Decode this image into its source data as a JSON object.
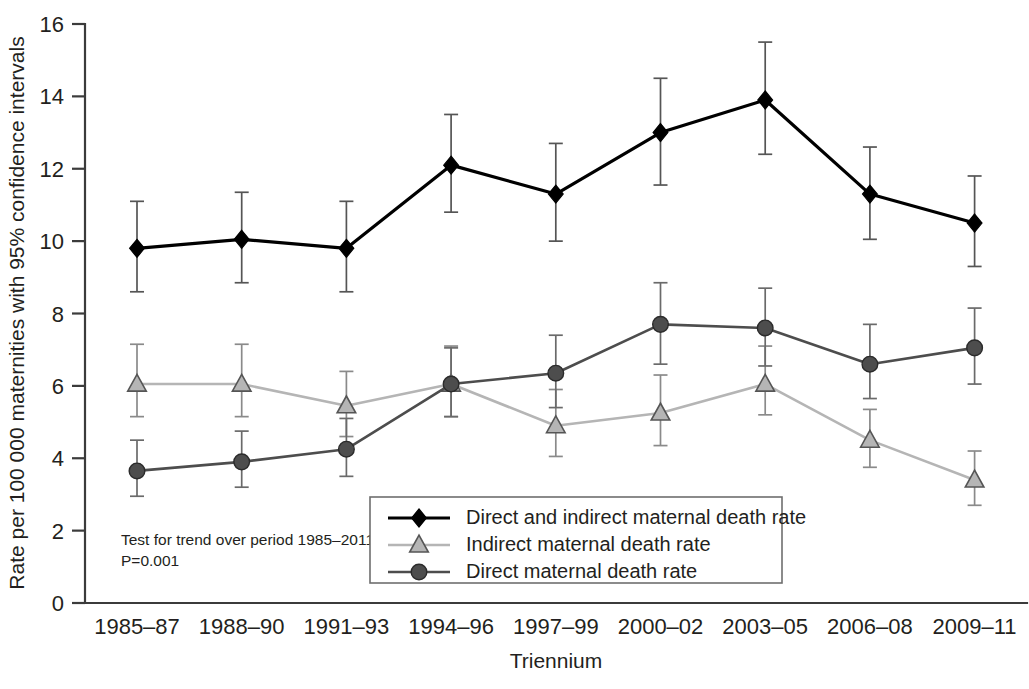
{
  "axes": {
    "ylabel": "Rate per 100 000 maternities with 95% confidence intervals",
    "xlabel": "Triennium",
    "y_ticks": [
      "0",
      "2",
      "4",
      "6",
      "8",
      "10",
      "12",
      "14",
      "16"
    ],
    "x_ticks": [
      "1985–87",
      "1988–90",
      "1991–93",
      "1994–96",
      "1997–99",
      "2000–02",
      "2003–05",
      "2006–08",
      "2009–11"
    ]
  },
  "annotation": {
    "line1": "Test for trend over period 1985–2011:",
    "line2": "P=0.001"
  },
  "legend": {
    "items": [
      {
        "label": "Direct and indirect maternal death rate",
        "marker": "diamond-marker",
        "color": "#000000"
      },
      {
        "label": "Indirect maternal death rate",
        "marker": "triangle-marker",
        "color": "#b5b5b5"
      },
      {
        "label": "Direct maternal death rate",
        "marker": "circle-marker",
        "color": "#4d4d4d"
      }
    ]
  },
  "chart_data": {
    "type": "line",
    "title": "",
    "xlabel": "Triennium",
    "ylabel": "Rate per 100 000 maternities with 95% confidence intervals",
    "ylim": [
      0,
      16
    ],
    "ytick_step": 2,
    "grid": false,
    "legend_position": "lower-center",
    "annotation": "Test for trend over period 1985–2011: P=0.001",
    "categories": [
      "1985–87",
      "1988–90",
      "1991–93",
      "1994–96",
      "1997–99",
      "2000–02",
      "2003–05",
      "2006–08",
      "2009–11"
    ],
    "series": [
      {
        "name": "Direct and indirect maternal death rate",
        "marker": "diamond",
        "color": "#000000",
        "values": [
          9.8,
          10.05,
          9.8,
          12.1,
          11.3,
          13.0,
          13.9,
          11.3,
          10.5
        ],
        "ci_lower": [
          8.6,
          8.85,
          8.6,
          10.8,
          10.0,
          11.55,
          12.4,
          10.05,
          9.3
        ],
        "ci_upper": [
          11.1,
          11.35,
          11.1,
          13.5,
          12.7,
          14.5,
          15.5,
          12.6,
          11.8
        ]
      },
      {
        "name": "Indirect maternal death rate",
        "marker": "triangle",
        "color": "#b5b5b5",
        "values": [
          6.05,
          6.05,
          5.45,
          6.05,
          4.9,
          5.25,
          6.05,
          4.5,
          3.4
        ],
        "ci_lower": [
          5.15,
          5.15,
          4.6,
          5.15,
          4.05,
          4.35,
          5.2,
          3.75,
          2.7
        ],
        "ci_upper": [
          7.15,
          7.15,
          6.4,
          7.1,
          5.9,
          6.3,
          7.1,
          5.35,
          4.2
        ]
      },
      {
        "name": "Direct maternal death rate",
        "marker": "circle",
        "color": "#4d4d4d",
        "values": [
          3.65,
          3.9,
          4.25,
          6.05,
          6.35,
          7.7,
          7.6,
          6.6,
          7.05
        ],
        "ci_lower": [
          2.95,
          3.2,
          3.5,
          5.15,
          5.4,
          6.6,
          6.55,
          5.65,
          6.05
        ],
        "ci_upper": [
          4.5,
          4.75,
          5.1,
          7.05,
          7.4,
          8.85,
          8.7,
          7.7,
          8.15
        ]
      }
    ]
  },
  "style": {
    "axis_color": "#3b3b3b",
    "background": "#ffffff",
    "text_color": "#231f20"
  }
}
